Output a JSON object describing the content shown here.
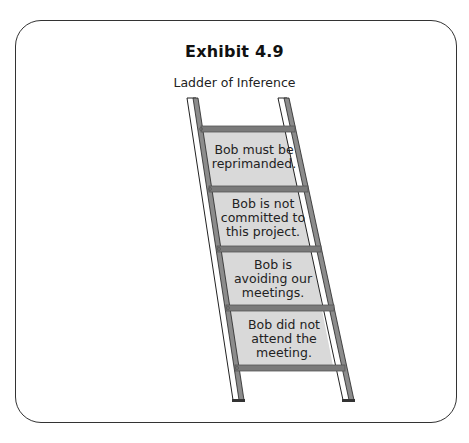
{
  "exhibit": {
    "title": "Exhibit 4.9",
    "subtitle": "Ladder of Inference"
  },
  "ladder": {
    "rungs_count": 5,
    "panels": [
      {
        "level": 4,
        "lines": [
          "Bob must be",
          "reprimanded."
        ]
      },
      {
        "level": 3,
        "lines": [
          "Bob is not",
          "committed to",
          "this project."
        ]
      },
      {
        "level": 2,
        "lines": [
          "Bob is",
          "avoiding our",
          "meetings."
        ]
      },
      {
        "level": 1,
        "lines": [
          "Bob did not",
          "attend the",
          "meeting."
        ]
      }
    ]
  },
  "colors": {
    "border": "#333333",
    "rung": "#7a7a7a",
    "panel": "#d9d9d9",
    "rail_fill": "#ffffff",
    "rail_shade": "#8c8c8c"
  }
}
